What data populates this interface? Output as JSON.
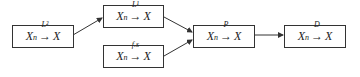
{
  "diagram": {
    "nodes": [
      {
        "id": "l2",
        "var": "X",
        "sub": "n",
        "mode": "L²",
        "target": "X"
      },
      {
        "id": "l1",
        "var": "X",
        "sub": "n",
        "mode": "L¹",
        "target": "X"
      },
      {
        "id": "as",
        "var": "X",
        "sub": "n",
        "mode": "f.s",
        "target": "X"
      },
      {
        "id": "p",
        "var": "X",
        "sub": "n",
        "mode": "P",
        "target": "X"
      },
      {
        "id": "d",
        "var": "X",
        "sub": "n",
        "mode": "D",
        "target": "X"
      }
    ],
    "edges": [
      {
        "from": "l2",
        "to": "l1"
      },
      {
        "from": "l1",
        "to": "p"
      },
      {
        "from": "as",
        "to": "p"
      },
      {
        "from": "p",
        "to": "d"
      }
    ],
    "arrow_symbol": "→"
  }
}
